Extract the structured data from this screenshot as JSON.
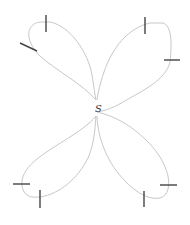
{
  "diagram": {
    "center_label": "S",
    "colors": {
      "curve": "#c8c8c8",
      "tick": "#444444",
      "label": "#333333",
      "background": "#ffffff"
    },
    "petals": [
      {
        "name": "upper-left",
        "ticks": 2
      },
      {
        "name": "upper-right",
        "ticks": 2
      },
      {
        "name": "lower-left",
        "ticks": 2
      },
      {
        "name": "lower-right",
        "ticks": 2
      }
    ]
  }
}
